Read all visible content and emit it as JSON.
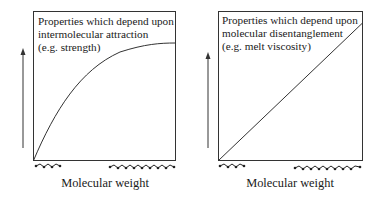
{
  "panels": [
    {
      "title_line1": "Properties which depend upon",
      "title_line2": "intermolecular attraction",
      "example": "(e.g. strength)",
      "xlabel": "Molecular weight",
      "curve": "saturating"
    },
    {
      "title_line1": "Properties which depend upon",
      "title_line2": "molecular disentanglement",
      "example": "(e.g. melt viscosity)",
      "xlabel": "Molecular weight",
      "curve": "linear"
    }
  ]
}
